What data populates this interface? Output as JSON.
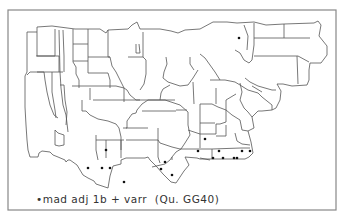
{
  "map": {
    "type": "dialect-dot-map",
    "frame_color": "#777777",
    "outline_color": "#444444",
    "dot_color": "#111111",
    "legend": {
      "marker": "•",
      "text": "mad adj 1b + varr  (Qu. GG40)"
    },
    "dots": [
      {
        "x": 239,
        "y": 38
      },
      {
        "x": 106,
        "y": 150
      },
      {
        "x": 88,
        "y": 168
      },
      {
        "x": 102,
        "y": 168
      },
      {
        "x": 110,
        "y": 168
      },
      {
        "x": 124,
        "y": 182
      },
      {
        "x": 165,
        "y": 162
      },
      {
        "x": 161,
        "y": 169
      },
      {
        "x": 172,
        "y": 175
      },
      {
        "x": 205,
        "y": 139
      },
      {
        "x": 198,
        "y": 151
      },
      {
        "x": 219,
        "y": 151
      },
      {
        "x": 213,
        "y": 158
      },
      {
        "x": 223,
        "y": 158
      },
      {
        "x": 234,
        "y": 158
      },
      {
        "x": 237,
        "y": 158
      },
      {
        "x": 242,
        "y": 151
      },
      {
        "x": 250,
        "y": 151
      }
    ]
  }
}
